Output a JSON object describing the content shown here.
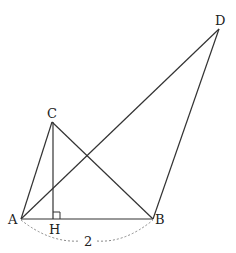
{
  "diagram": {
    "points": {
      "A": {
        "label": "A",
        "x": 21,
        "y": 219
      },
      "B": {
        "label": "B",
        "x": 153,
        "y": 219
      },
      "C": {
        "label": "C",
        "x": 52,
        "y": 122
      },
      "D": {
        "label": "D",
        "x": 219,
        "y": 29
      },
      "H": {
        "label": "H",
        "x": 53,
        "y": 219
      }
    },
    "segments": [
      "AB",
      "AC",
      "CB",
      "AD",
      "BD",
      "CH"
    ],
    "right_angle_at": "H",
    "dimension": {
      "between": "AB",
      "label": "2"
    },
    "colors": {
      "line": "#333333",
      "dashed": "#888888"
    }
  }
}
